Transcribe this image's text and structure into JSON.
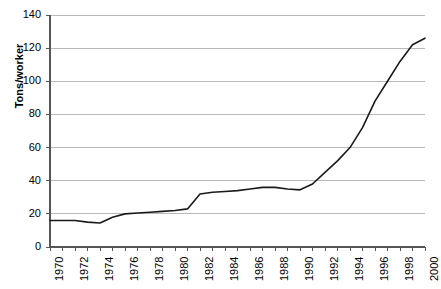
{
  "chart_data": {
    "type": "line",
    "title": "",
    "xlabel": "",
    "ylabel": "Tons/worker",
    "xlim": [
      1970,
      2000
    ],
    "ylim": [
      0,
      140
    ],
    "grid": true,
    "legend": "none",
    "y_ticks": [
      0,
      20,
      40,
      60,
      80,
      100,
      120,
      140
    ],
    "x_ticks": [
      1970,
      1972,
      1974,
      1976,
      1978,
      1980,
      1982,
      1984,
      1986,
      1988,
      1990,
      1992,
      1994,
      1996,
      1998,
      2000
    ],
    "x_tick_labels": [
      "1970",
      "1972",
      "1974",
      "1976",
      "1978",
      "1980",
      "1982",
      "1984",
      "1986",
      "1988",
      "1990",
      "1992",
      "1994",
      "1996",
      "1998",
      "2000"
    ],
    "y_tick_labels": [
      "0",
      "20",
      "40",
      "60",
      "80",
      "100",
      "120",
      "140"
    ],
    "series": [
      {
        "name": "Tons per worker",
        "color": "#1a1a1a",
        "x": [
          1970,
          1971,
          1972,
          1973,
          1974,
          1975,
          1976,
          1977,
          1978,
          1979,
          1980,
          1981,
          1982,
          1983,
          1984,
          1985,
          1986,
          1987,
          1988,
          1989,
          1990,
          1991,
          1992,
          1993,
          1994,
          1995,
          1996,
          1997,
          1998,
          1999,
          2000
        ],
        "values": [
          16,
          16,
          16,
          15,
          14.5,
          18,
          20,
          20.5,
          21,
          21.5,
          22,
          23,
          32,
          33,
          33.5,
          34,
          35,
          36,
          36,
          35,
          34.5,
          38,
          45,
          52,
          60,
          72,
          88,
          100,
          112,
          122,
          126
        ]
      }
    ]
  },
  "axes": {
    "axis_color": "#555555",
    "grid_color": "#b8b8b8",
    "tick_color": "#555555"
  }
}
